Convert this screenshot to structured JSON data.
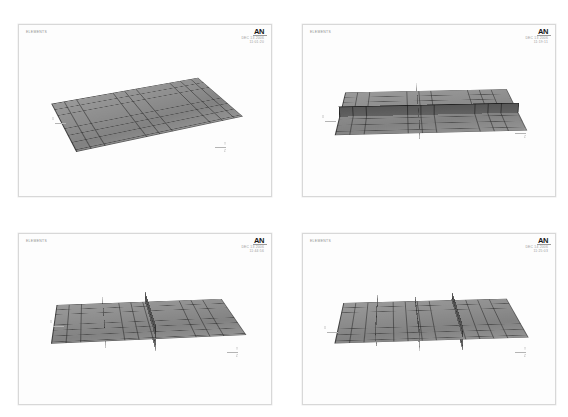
{
  "figure": {
    "layout": "2x2 grid of ANSYS element plots",
    "background_color": "#ffffff",
    "panel_border_color": "#d8d8d8",
    "mesh_color": "#8e8e8e",
    "stiffener_color": "#5a5a5a",
    "gridline_color": "#282828",
    "logo_color": "#161616",
    "stamp_color": "#9a9a9a"
  },
  "panels": [
    {
      "id": "panel-1",
      "plot_label": "ELEMENTS",
      "logo": "AN",
      "date": "DEC 13 2006",
      "time": "11:01:20",
      "axis_labels": [
        "X",
        "Y",
        "Z"
      ],
      "model": "unstiffened curved plate mesh",
      "stiffener_count": 0,
      "stiffener_type": "none"
    },
    {
      "id": "panel-2",
      "plot_label": "ELEMENTS",
      "logo": "AN",
      "date": "DEC 13 2006",
      "time": "11:19:11",
      "axis_labels": [
        "X",
        "Y",
        "Z"
      ],
      "model": "plate with cruciform stiffeners",
      "stiffener_count": 2,
      "stiffener_type": "cross"
    },
    {
      "id": "panel-3",
      "plot_label": "ELEMENTS",
      "logo": "AN",
      "date": "DEC 13 2006",
      "time": "11:44:56",
      "axis_labels": [
        "X",
        "Y",
        "Z"
      ],
      "model": "plate with two transverse stiffeners",
      "stiffener_count": 2,
      "stiffener_type": "transverse"
    },
    {
      "id": "panel-4",
      "plot_label": "ELEMENTS",
      "logo": "AN",
      "date": "DEC 14 2006",
      "time": "11:25:03",
      "axis_labels": [
        "X",
        "Y",
        "Z"
      ],
      "model": "plate with three transverse stiffeners",
      "stiffener_count": 3,
      "stiffener_type": "transverse"
    }
  ]
}
